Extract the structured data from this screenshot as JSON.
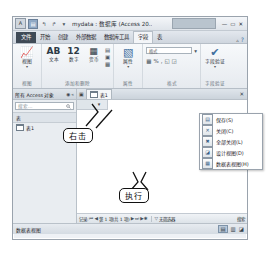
{
  "window": {
    "app_icon": "A",
    "title": "mydata : 数据库 (Access 20..",
    "quick_access": [
      {
        "name": "save-icon",
        "glyph": "▤"
      },
      {
        "name": "undo-icon",
        "glyph": "↰"
      },
      {
        "name": "redo-icon",
        "glyph": "↱"
      },
      {
        "name": "customize-qat-icon",
        "glyph": "▾"
      }
    ],
    "controls": [
      {
        "name": "minimize-button",
        "glyph": "—"
      },
      {
        "name": "restore-button",
        "glyph": "▭"
      },
      {
        "name": "close-button",
        "glyph": "✕"
      }
    ]
  },
  "ribbon": {
    "tabs": [
      {
        "label": "文件",
        "state": "file"
      },
      {
        "label": "开始",
        "state": "normal"
      },
      {
        "label": "创建",
        "state": "normal"
      },
      {
        "label": "外部数据",
        "state": "normal"
      },
      {
        "label": "数据库工具",
        "state": "normal"
      },
      {
        "label": "字段",
        "state": "active"
      },
      {
        "label": "表",
        "state": "normal"
      }
    ],
    "collapse_icon": "▵",
    "help_icon": "?",
    "groups": [
      {
        "label": "视图",
        "big_button": {
          "icon": "📈",
          "label": "视图",
          "caret": "▾"
        }
      },
      {
        "label": "添加和删除",
        "buttons": [
          {
            "icon": "AB",
            "label": "文本"
          },
          {
            "icon": "12",
            "label": "数字"
          },
          {
            "icon": "▦",
            "label": "货币"
          }
        ],
        "mini_icons": [
          "▤",
          "▣",
          "▦"
        ]
      },
      {
        "label": "属性",
        "big_button": {
          "icon": "▧",
          "label": "属性",
          "caret": "▾"
        }
      },
      {
        "label": "格式",
        "format_value": "格式",
        "format_caret": "▾",
        "icons": [
          "▦",
          "%",
          ",",
          "◱",
          "◲"
        ]
      },
      {
        "label": "字段验证",
        "big_button": {
          "icon": "✔",
          "label": "字段验证",
          "caret": "▾"
        }
      }
    ]
  },
  "nav_pane": {
    "header": "所有 Access 对象",
    "header_icons": [
      "◉",
      "«"
    ],
    "search_placeholder": "搜索...",
    "search_icon": "🔎",
    "group": "表",
    "items": [
      {
        "label": "表1",
        "icon": "table-icon"
      }
    ]
  },
  "document": {
    "close_icon": "▣",
    "tab_label": "表1",
    "tab_icon": "table-icon",
    "close_button": "✕",
    "add_field_header": "单击以添加",
    "add_field_caret": "▾"
  },
  "context_menu": {
    "items": [
      {
        "label": "保存(S)",
        "icon": "▤"
      },
      {
        "label": "关闭(C)",
        "icon": "✕"
      },
      {
        "label": "全部关闭(L)",
        "icon": "✖"
      },
      {
        "label": "设计视图(D)",
        "icon": "◪"
      },
      {
        "label": "数据表视图(H)",
        "icon": "▦"
      }
    ]
  },
  "record_nav": {
    "label": "记录:",
    "first": "⏮",
    "prev": "◀",
    "position": "第 1 项(共 1 项)",
    "next": "▶",
    "last": "⏭",
    "new": "▶✱",
    "filter_icon": "▽",
    "filter_text": "无筛选器",
    "search_label": "搜索"
  },
  "status_bar": {
    "view_label": "数据表视图",
    "view_icons": [
      {
        "name": "datasheet-view-icon",
        "glyph": "▤",
        "selected": true
      },
      {
        "name": "pivot-view-icon",
        "glyph": "▥",
        "selected": false
      },
      {
        "name": "design-view-icon",
        "glyph": "◪",
        "selected": false
      }
    ]
  },
  "annotations": [
    {
      "name": "right-click-callout",
      "label": "右击"
    },
    {
      "name": "execute-callout",
      "label": "执行"
    }
  ]
}
